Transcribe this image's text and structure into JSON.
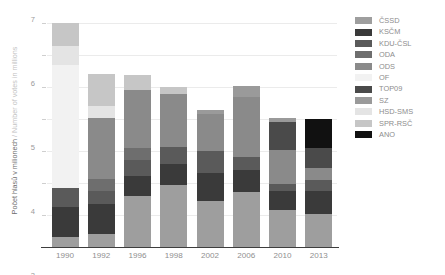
{
  "axis": {
    "y_title_cz": "Počet hlasů v milionech",
    "y_title_sep": " / ",
    "y_title_en": "Number of votes in millions",
    "y_ticks": [
      "0",
      "1",
      "2",
      "3",
      "4",
      "5",
      "6",
      "7"
    ]
  },
  "legend": {
    "items": [
      {
        "label": "ČSSD",
        "color": "#9e9e9e"
      },
      {
        "label": "KSČM",
        "color": "#3a3a3a"
      },
      {
        "label": "KDU-ČSL",
        "color": "#5a5a5a"
      },
      {
        "label": "ODA",
        "color": "#6e6e6e"
      },
      {
        "label": "ODS",
        "color": "#8a8a8a"
      },
      {
        "label": "OF",
        "color": "#f2f2f2"
      },
      {
        "label": "TOP09",
        "color": "#4a4a4a"
      },
      {
        "label": "SZ",
        "color": "#9a9a9a"
      },
      {
        "label": "HSD-SMS",
        "color": "#e4e4e4"
      },
      {
        "label": "SPR-RSČ",
        "color": "#c6c6c6"
      },
      {
        "label": "ANO",
        "color": "#111111"
      }
    ]
  },
  "chart_data": {
    "type": "bar",
    "subtype": "stacked",
    "title": "",
    "xlabel": "",
    "ylabel": "Počet hlasů v milionech / Number of votes in millions",
    "ylim": [
      0,
      7
    ],
    "grid": true,
    "legend_position": "right",
    "categories": [
      "1990",
      "1992",
      "1996",
      "1998",
      "2002",
      "2006",
      "2010",
      "2013"
    ],
    "series": [
      {
        "name": "ČSSD",
        "color": "#9e9e9e",
        "values": [
          0.3,
          0.42,
          1.6,
          1.93,
          1.44,
          1.73,
          1.16,
          1.02
        ]
      },
      {
        "name": "KSČM",
        "color": "#3a3a3a",
        "values": [
          0.95,
          0.91,
          0.63,
          0.66,
          0.88,
          0.69,
          0.59,
          0.74
        ]
      },
      {
        "name": "KDU-ČSL",
        "color": "#5a5a5a",
        "values": [
          0.6,
          0.41,
          0.49,
          0.54,
          0.68,
          0.39,
          0.23,
          0.34
        ]
      },
      {
        "name": "ODA",
        "color": "#6e6e6e",
        "values": [
          0.0,
          0.38,
          0.39,
          0.0,
          0.0,
          0.0,
          0.0,
          0.0
        ]
      },
      {
        "name": "ODS",
        "color": "#8a8a8a",
        "values": [
          0.0,
          1.92,
          1.79,
          1.66,
          1.17,
          1.89,
          1.06,
          0.38
        ]
      },
      {
        "name": "OF",
        "color": "#f2f2f2",
        "values": [
          3.85,
          0.0,
          0.0,
          0.0,
          0.0,
          0.0,
          0.0,
          0.0
        ]
      },
      {
        "name": "TOP09",
        "color": "#4a4a4a",
        "values": [
          0.0,
          0.0,
          0.0,
          0.0,
          0.0,
          0.0,
          0.87,
          0.6
        ]
      },
      {
        "name": "SZ",
        "color": "#9a9a9a",
        "values": [
          0.0,
          0.0,
          0.0,
          0.0,
          0.11,
          0.34,
          0.13,
          0.0
        ]
      },
      {
        "name": "HSD-SMS",
        "color": "#e4e4e4",
        "values": [
          0.57,
          0.38,
          0.0,
          0.0,
          0.0,
          0.0,
          0.0,
          0.0
        ]
      },
      {
        "name": "SPR-RSČ",
        "color": "#c6c6c6",
        "values": [
          0.73,
          1.0,
          0.49,
          0.22,
          0.0,
          0.0,
          0.0,
          0.0
        ]
      },
      {
        "name": "ANO",
        "color": "#111111",
        "values": [
          0.0,
          0.0,
          0.0,
          0.0,
          0.0,
          0.0,
          0.0,
          0.93
        ]
      }
    ],
    "totals": [
      7.0,
      5.42,
      5.39,
      5.01,
      4.28,
      5.04,
      4.04,
      4.01
    ]
  }
}
